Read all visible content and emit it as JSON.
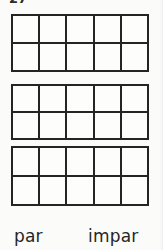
{
  "page": {
    "header_number": "27",
    "background_color": "#fbfbf9",
    "ink_color": "#242424"
  },
  "frames": [
    {
      "name": "ten-frame-1",
      "columns": 5,
      "rows": 2,
      "total_cells": 10,
      "filled_cells": 0
    },
    {
      "name": "ten-frame-2",
      "columns": 5,
      "rows": 2,
      "total_cells": 10,
      "filled_cells": 0
    },
    {
      "name": "ten-frame-3",
      "columns": 5,
      "rows": 2,
      "total_cells": 10,
      "filled_cells": 0
    }
  ],
  "labels": {
    "even": "par",
    "odd": "impar"
  }
}
